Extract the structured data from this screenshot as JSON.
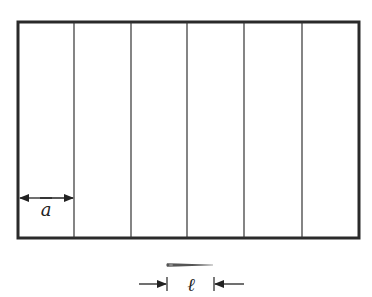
{
  "diagram": {
    "type": "buffon-needle-setup",
    "frame": {
      "x": 18,
      "y": 22,
      "width": 341,
      "height": 216,
      "stroke": "#2a2a2a",
      "stroke_width": 3
    },
    "strip_lines_x": [
      74,
      131,
      187,
      244,
      302
    ],
    "strip_line_color": "#333333",
    "spacing_label": "a",
    "needle_length_label": "ℓ",
    "needle": {
      "x1": 167,
      "x2": 213,
      "y": 265,
      "color": "#555555"
    }
  }
}
